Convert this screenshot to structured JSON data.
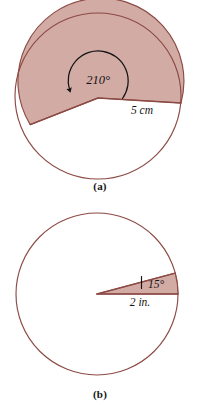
{
  "page": {
    "background_color": "#ffffff",
    "width": 200,
    "height": 412
  },
  "style": {
    "sector_fill": "#d3aba5",
    "stroke_color": "#8c4a44",
    "text_color": "#131313",
    "caption_color": "#161616"
  },
  "figures": [
    {
      "id": "a",
      "caption": "(a)",
      "shape": "circle-with-shaded-sector",
      "center": {
        "x": 98,
        "y": 96
      },
      "radius_px": 83,
      "angle_label": "210°",
      "angle_value": 210,
      "radius_label": "5 cm",
      "radius_value": 5,
      "radius_unit": "cm",
      "arc_arrow": "counterclockwise-arrow",
      "sector_start_deg": 176,
      "sector_end_deg": 386
    },
    {
      "id": "b",
      "caption": "(b)",
      "shape": "circle-with-shaded-sector",
      "center": {
        "x": 97,
        "y": 294
      },
      "radius_px": 81,
      "angle_label": "15°",
      "angle_value": 15,
      "radius_label": "2 in.",
      "radius_value": 2,
      "radius_unit": "in.",
      "sector_start_deg": -15,
      "sector_end_deg": 0
    }
  ]
}
